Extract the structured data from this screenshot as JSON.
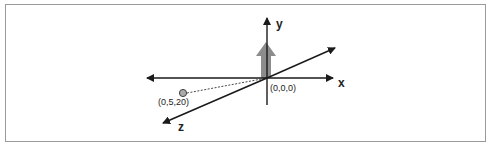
{
  "diagram": {
    "type": "3d-coordinate-axes",
    "axes": {
      "x": {
        "label": "x"
      },
      "y": {
        "label": "y"
      },
      "z": {
        "label": "z"
      }
    },
    "origin": {
      "label": "(0,0,0)"
    },
    "point": {
      "label": "(0,5,20)",
      "color": "#aaaaaa"
    },
    "up_arrow": {
      "color": "#8c8c8c"
    },
    "axis_color": "#1a1a1a"
  }
}
